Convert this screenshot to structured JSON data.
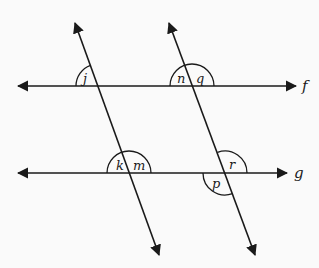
{
  "diagram": {
    "type": "parallel lines cut by two transversals",
    "parallel_lines": [
      {
        "name": "f",
        "label": "f"
      },
      {
        "name": "g",
        "label": "g"
      }
    ],
    "transversals": [
      {
        "name": "left-transversal"
      },
      {
        "name": "right-transversal"
      }
    ],
    "angles": [
      {
        "label": "j",
        "line": "f",
        "transversal": "left",
        "position": "upper-left"
      },
      {
        "label": "n",
        "line": "f",
        "transversal": "right",
        "position": "upper-left"
      },
      {
        "label": "q",
        "line": "f",
        "transversal": "right",
        "position": "upper-right"
      },
      {
        "label": "k",
        "line": "g",
        "transversal": "left",
        "position": "upper-left"
      },
      {
        "label": "m",
        "line": "g",
        "transversal": "left",
        "position": "upper-right"
      },
      {
        "label": "r",
        "line": "g",
        "transversal": "right",
        "position": "upper-right"
      },
      {
        "label": "p",
        "line": "g",
        "transversal": "right",
        "position": "lower-left"
      }
    ]
  }
}
